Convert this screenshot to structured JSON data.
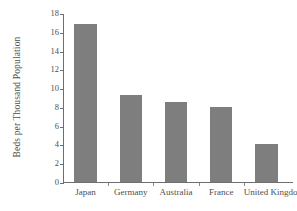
{
  "chart_data": {
    "type": "bar",
    "title": "",
    "subtitle": "",
    "xlabel": "",
    "ylabel": "Beds per Thousand Population",
    "categories": [
      "Japan",
      "Germany",
      "Australia",
      "France",
      "United Kingdom"
    ],
    "values": [
      16.8,
      9.3,
      8.5,
      8.0,
      4.0
    ],
    "series": [
      {
        "name": "Beds per Thousand Population",
        "values": [
          16.8,
          9.3,
          8.5,
          8.0,
          4.0
        ]
      }
    ],
    "ylim": [
      0,
      18
    ],
    "ytick_values": [
      0,
      2,
      4,
      6,
      8,
      10,
      12,
      14,
      16,
      18
    ],
    "ytick_labels": [
      "0",
      "2",
      "4",
      "6",
      "8",
      "10",
      "12",
      "14",
      "16",
      "18"
    ],
    "grid": false,
    "legend": false,
    "legend_position": "none",
    "bar_color": "#7e7e7e",
    "axis_color": "#6e6e6e",
    "text_color": "#4f4f4f",
    "background_color": "#ffffff",
    "annotations": []
  }
}
